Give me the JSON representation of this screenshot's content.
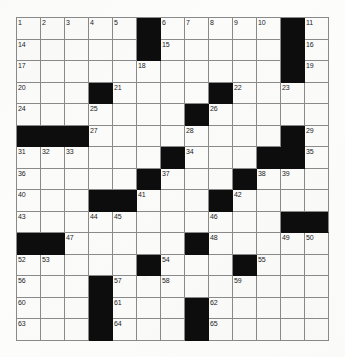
{
  "puzzle": {
    "type": "crossword-grid",
    "columns": 13,
    "rows": 15,
    "colors": {
      "paper": "#fdfdfc",
      "cell_fill": "#fbfbfa",
      "block_fill": "#0d0d0d",
      "grid_line": "#8a8a8a",
      "number_text": "#1b1b1b"
    },
    "max_clue_number": 65,
    "cells": [
      [
        {
          "n": "1"
        },
        {
          "n": "2"
        },
        {
          "n": "3"
        },
        {
          "n": "4"
        },
        {
          "n": "5"
        },
        {
          "b": true
        },
        {
          "n": "6"
        },
        {
          "n": "7"
        },
        {
          "n": "8"
        },
        {
          "n": "9"
        },
        {
          "n": "10"
        },
        {
          "b": true
        },
        {
          "n": "11"
        },
        {
          "n": "12"
        },
        {
          "n": "13"
        }
      ],
      [
        {
          "n": "14"
        },
        {},
        {},
        {},
        {},
        {
          "b": true
        },
        {
          "n": "15"
        },
        {},
        {},
        {},
        {},
        {
          "b": true
        },
        {
          "n": "16"
        },
        {},
        {}
      ],
      [
        {
          "n": "17"
        },
        {},
        {},
        {},
        {},
        {
          "n": "18"
        },
        {},
        {},
        {},
        {},
        {},
        {
          "b": true
        },
        {
          "n": "19"
        },
        {},
        {}
      ],
      [
        {
          "n": "20"
        },
        {},
        {},
        {
          "b": true
        },
        {
          "n": "21"
        },
        {},
        {},
        {},
        {
          "b": true
        },
        {
          "n": "22"
        },
        {},
        {
          "n": "23"
        },
        {},
        {},
        {}
      ],
      [
        {
          "n": "24"
        },
        {},
        {},
        {
          "n": "25"
        },
        {},
        {},
        {},
        {
          "b": true
        },
        {
          "n": "26"
        },
        {},
        {},
        {},
        {},
        {
          "b": true
        },
        {
          "b": true
        }
      ],
      [
        {
          "b": true
        },
        {
          "b": true
        },
        {
          "b": true
        },
        {
          "n": "27"
        },
        {},
        {},
        {},
        {
          "n": "28"
        },
        {},
        {},
        {},
        {
          "b": true
        },
        {
          "n": "29"
        },
        {
          "n": "30"
        }
      ],
      [
        {
          "n": "31"
        },
        {
          "n": "32"
        },
        {
          "n": "33"
        },
        {},
        {},
        {},
        {
          "b": true
        },
        {
          "n": "34"
        },
        {},
        {},
        {
          "b": true
        },
        {
          "b": true
        },
        {
          "n": "35"
        },
        {},
        {}
      ],
      [
        {
          "n": "36"
        },
        {},
        {},
        {},
        {},
        {
          "b": true
        },
        {
          "n": "37"
        },
        {},
        {},
        {
          "b": true
        },
        {
          "n": "38"
        },
        {
          "n": "39"
        },
        {},
        {},
        {}
      ],
      [
        {
          "n": "40"
        },
        {},
        {},
        {
          "b": true
        },
        {
          "b": true
        },
        {
          "n": "41"
        },
        {},
        {},
        {
          "b": true
        },
        {
          "n": "42"
        },
        {},
        {},
        {},
        {},
        {}
      ],
      [
        {
          "n": "43"
        },
        {},
        {},
        {
          "n": "44"
        },
        {
          "n": "45"
        },
        {},
        {},
        {},
        {
          "n": "46"
        },
        {},
        {},
        {
          "b": true
        },
        {
          "b": true
        },
        {
          "b": true
        }
      ],
      [
        {
          "b": true
        },
        {
          "b": true
        },
        {
          "n": "47"
        },
        {},
        {},
        {},
        {},
        {
          "b": true
        },
        {
          "n": "48"
        },
        {},
        {},
        {
          "n": "49"
        },
        {
          "n": "50"
        },
        {
          "n": "51"
        }
      ],
      [
        {
          "n": "52"
        },
        {
          "n": "53"
        },
        {},
        {},
        {},
        {
          "b": true
        },
        {
          "n": "54"
        },
        {},
        {},
        {
          "b": true
        },
        {
          "n": "55"
        },
        {},
        {},
        {},
        {}
      ],
      [
        {
          "n": "56"
        },
        {},
        {},
        {
          "b": true
        },
        {
          "n": "57"
        },
        {},
        {
          "n": "58"
        },
        {},
        {},
        {
          "n": "59"
        },
        {},
        {},
        {},
        {},
        {}
      ],
      [
        {
          "n": "60"
        },
        {},
        {},
        {
          "b": true
        },
        {
          "n": "61"
        },
        {},
        {},
        {
          "b": true
        },
        {
          "n": "62"
        },
        {},
        {},
        {},
        {},
        {},
        {}
      ],
      [
        {
          "n": "63"
        },
        {},
        {},
        {
          "b": true
        },
        {
          "n": "64"
        },
        {},
        {},
        {
          "b": true
        },
        {
          "n": "65"
        },
        {},
        {},
        {},
        {},
        {},
        {}
      ]
    ]
  }
}
